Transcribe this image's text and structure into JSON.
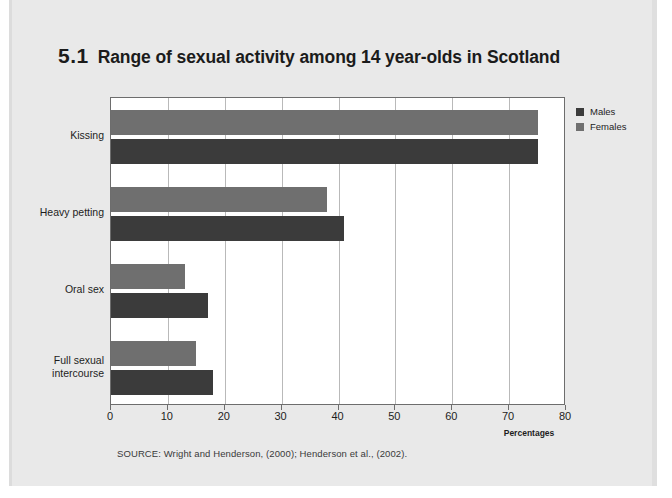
{
  "figure": {
    "number": "5.1",
    "title": "Range of sexual activity among 14 year-olds in Scotland",
    "source_note": "SOURCE: Wright and Henderson, (2000); Henderson et al., (2002)."
  },
  "legend": {
    "position": "right",
    "entries": [
      {
        "label": "Males",
        "color": "#3b3b3b",
        "swatch_name": "legend-swatch-males"
      },
      {
        "label": "Females",
        "color": "#6f6f6f",
        "swatch_name": "legend-swatch-females"
      }
    ]
  },
  "chart_data": {
    "type": "bar",
    "orientation": "horizontal",
    "title": "Range of sexual activity among 14 year-olds in Scotland",
    "xlabel": "Percentages",
    "ylabel": "",
    "xlim": [
      0,
      80
    ],
    "xticks": [
      0,
      10,
      20,
      30,
      40,
      50,
      60,
      70,
      80
    ],
    "xtick_labels": [
      "0",
      "10",
      "20",
      "30",
      "40",
      "50",
      "60",
      "70",
      "80"
    ],
    "grid": "vertical",
    "legend_position": "right",
    "categories": [
      "Kissing",
      "Heavy petting",
      "Oral sex",
      "Full sexual intercourse"
    ],
    "category_label_lines": [
      [
        "Kissing"
      ],
      [
        "Heavy petting"
      ],
      [
        "Oral sex"
      ],
      [
        "Full sexual",
        "intercourse"
      ]
    ],
    "series": [
      {
        "name": "Males",
        "color": "#3b3b3b",
        "values": [
          75,
          41,
          17,
          18
        ]
      },
      {
        "name": "Females",
        "color": "#6f6f6f",
        "values": [
          75,
          38,
          13,
          15
        ]
      }
    ]
  }
}
